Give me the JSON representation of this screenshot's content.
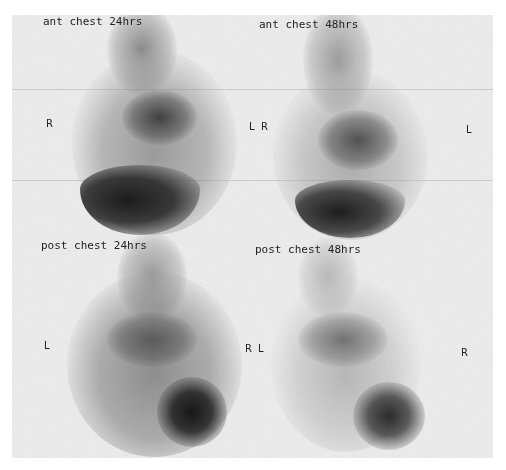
{
  "figure": {
    "panels": [
      {
        "id": "ant-24",
        "title": "ant chest 24hrs",
        "left_marker": "R",
        "right_marker": "L"
      },
      {
        "id": "ant-48",
        "title": "ant chest 48hrs",
        "left_marker": "R",
        "right_marker": "L"
      },
      {
        "id": "post-24",
        "title": "post chest 24hrs",
        "left_marker": "L",
        "right_marker": "R"
      },
      {
        "id": "post-48",
        "title": "post chest 48hrs",
        "left_marker": "L",
        "right_marker": "R"
      }
    ],
    "colors": {
      "background": "#ececec",
      "uptake_dark": "#1a1a1a",
      "uptake_mid": "#6a6a6a"
    }
  }
}
